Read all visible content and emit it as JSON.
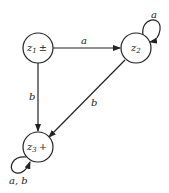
{
  "diagram": {
    "type": "finite-automaton",
    "states": [
      {
        "id": "z1",
        "name": "z",
        "sub": "1",
        "mark": "±"
      },
      {
        "id": "z2",
        "name": "z",
        "sub": "2",
        "mark": ""
      },
      {
        "id": "z3",
        "name": "z",
        "sub": "3",
        "mark": "+"
      }
    ],
    "transitions": [
      {
        "from": "z1",
        "to": "z2",
        "label": "a"
      },
      {
        "from": "z2",
        "to": "z2",
        "label": "a"
      },
      {
        "from": "z1",
        "to": "z3",
        "label": "b"
      },
      {
        "from": "z2",
        "to": "z3",
        "label": "b"
      },
      {
        "from": "z3",
        "to": "z3",
        "label": "a, b"
      }
    ]
  }
}
